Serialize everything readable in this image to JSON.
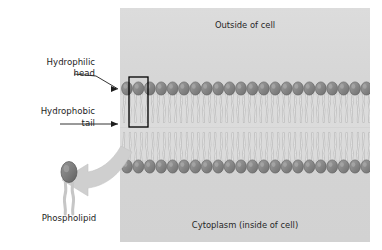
{
  "diagram": {
    "type": "biology-diagram"
  },
  "panel": {
    "top_label": "Outside of cell",
    "bottom_label": "Cytoplasm (inside of cell)",
    "background_color": "#d6d6d6",
    "bounds": {
      "x": 120,
      "y": 8,
      "width": 250,
      "height": 234
    }
  },
  "membrane": {
    "head_count_per_row": 22,
    "head_color": "#8a8a8a",
    "head_outline_color": "#5d5d5d",
    "tail_color": "#d9d9d9",
    "tail_outline_color": "#b4b4b4",
    "upper_heads_y": 89,
    "lower_heads_y": 166,
    "leaflet_gap_y": 127
  },
  "highlight_box": {
    "label": "highlighted phospholipid",
    "color": "#000000",
    "x": 129,
    "y": 77,
    "width": 19,
    "height": 50
  },
  "labels": {
    "hydrophilic": {
      "line1": "Hydrophilic",
      "line2": "head"
    },
    "hydrophobic": {
      "line1": "Hydrophobic",
      "line2": "tail"
    },
    "phospholipid": "Phospholipid"
  },
  "callout_arrow": {
    "name": "zoom-callout-arrow",
    "color": "#cdcdcd",
    "direction": "left",
    "from": "membrane",
    "to": "phospholipid-molecule"
  },
  "phospholipid_molecule": {
    "head_color": "#7e7e7e",
    "tail_color": "#cfcfcf",
    "head_cx": 69,
    "head_cy": 173,
    "tails": 2
  },
  "leader_lines": [
    {
      "name": "hydrophilic-leader",
      "target_x": 122,
      "target_y": 89
    },
    {
      "name": "hydrophobic-leader",
      "target_x": 122,
      "target_y": 124
    }
  ]
}
